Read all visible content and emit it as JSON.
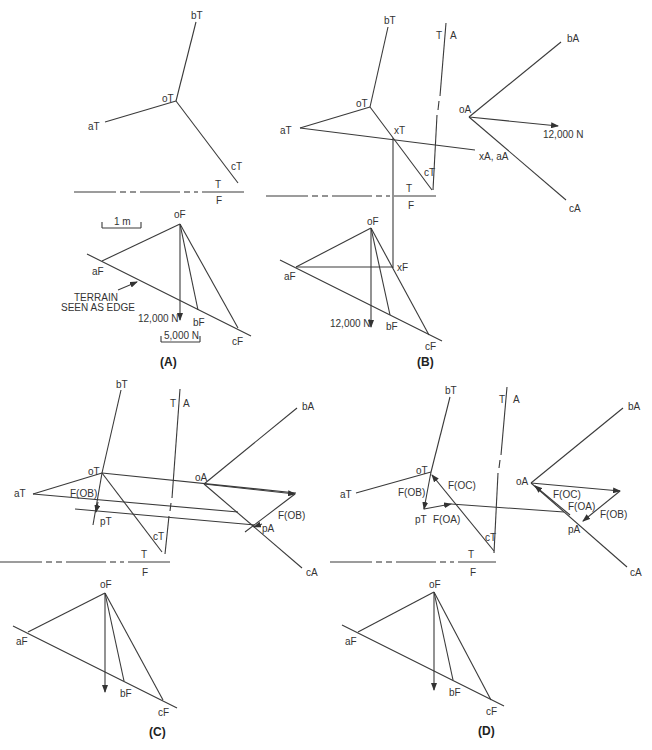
{
  "figure": {
    "panels": [
      {
        "id": "A",
        "caption": "(A)",
        "labels": {
          "oT": "oT",
          "aT": "aT",
          "bT": "bT",
          "cT": "cT",
          "fold_T": "T",
          "fold_F": "F",
          "oF": "oF",
          "aF": "aF",
          "bF": "bF",
          "cF": "cF",
          "scale_length": "1 m",
          "scale_force": "5,000 N",
          "load": "12,000 N",
          "terrain_line1": "TERRAIN",
          "terrain_line2": "SEEN AS EDGE"
        }
      },
      {
        "id": "B",
        "caption": "(B)",
        "labels": {
          "oT": "oT",
          "aT": "aT",
          "bT": "bT",
          "cT": "cT",
          "xT": "xT",
          "fold_TA_T": "T",
          "fold_TA_A": "A",
          "fold_T": "T",
          "fold_F": "F",
          "oA": "oA",
          "bA": "bA",
          "cA": "cA",
          "xA_aA": "xA, aA",
          "load_A": "12,000 N",
          "oF": "oF",
          "aF": "aF",
          "bF": "bF",
          "cF": "cF",
          "xF": "xF",
          "load_F": "12,000 N"
        }
      },
      {
        "id": "C",
        "caption": "(C)",
        "labels": {
          "oT": "oT",
          "aT": "aT",
          "bT": "bT",
          "cT": "cT",
          "pT": "pT",
          "fob_T": "F(OB)",
          "fold_TA_T": "T",
          "fold_TA_A": "A",
          "fold_T": "T",
          "fold_F": "F",
          "oA": "oA",
          "bA": "bA",
          "cA": "cA",
          "pA": "pA",
          "fob_A": "F(OB)",
          "oF": "oF",
          "aF": "aF",
          "bF": "bF",
          "cF": "cF"
        }
      },
      {
        "id": "D",
        "caption": "(D)",
        "labels": {
          "oT": "oT",
          "aT": "aT",
          "bT": "bT",
          "cT": "cT",
          "pT": "pT",
          "fob_T": "F(OB)",
          "foc_T": "F(OC)",
          "foa_T": "F(OA)",
          "fold_TA_T": "T",
          "fold_TA_A": "A",
          "fold_T": "T",
          "fold_F": "F",
          "oA": "oA",
          "bA": "bA",
          "cA": "cA",
          "pA": "pA",
          "foc_A": "F(OC)",
          "foa_A": "F(OA)",
          "fob_A": "F(OB)",
          "oF": "oF",
          "aF": "aF",
          "bF": "bF",
          "cF": "cF"
        }
      }
    ]
  }
}
